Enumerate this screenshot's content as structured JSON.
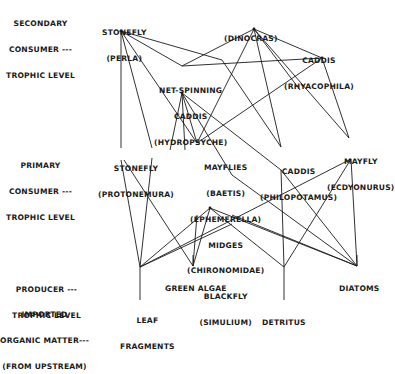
{
  "levels": [
    {
      "id": "secondary",
      "lines": [
        "SECONDARY",
        "CONSUMER ---",
        "TROPHIC LEVEL"
      ]
    },
    {
      "id": "primary",
      "lines": [
        "PRIMARY",
        "CONSUMER ---",
        "TROPHIC LEVEL"
      ]
    },
    {
      "id": "producer",
      "lines": [
        "PRODUCER ---",
        "TROPHIC LEVEL"
      ]
    },
    {
      "id": "imported",
      "lines": [
        "IMPORTED",
        "ORGANIC MATTER---",
        "(FROM UPSTREAM)"
      ]
    }
  ],
  "nodes": {
    "perla": {
      "lines": [
        "STONEFLY",
        "(PERLA)"
      ]
    },
    "dinocras": {
      "lines": [
        "(DINOCRAS)"
      ]
    },
    "rhyacophila": {
      "lines": [
        "CADDIS",
        "(RHYACOPHILA)"
      ]
    },
    "hydropsyche": {
      "lines": [
        "NET-SPINNING",
        "CADDIS",
        "(HYDROPSYCHE)"
      ]
    },
    "protonemura": {
      "lines": [
        "STONEFLY",
        "(PROTONEMURA)"
      ]
    },
    "baetis_group": {
      "lines": [
        "MAYFLIES",
        "(BAETIS)",
        "(EPHEMERELLA)",
        "MIDGES",
        "(CHIRONOMIDAE)",
        "BLACKFLY",
        "(SIMULIUM)"
      ]
    },
    "philopotamus": {
      "lines": [
        "CADDIS",
        "(PHILOPOTAMUS)"
      ]
    },
    "ecdyonurus": {
      "lines": [
        "MAYFLY",
        "(ECDYONURUS)"
      ]
    },
    "leaf": {
      "lines": [
        "LEAF",
        "FRAGMENTS"
      ]
    },
    "algae": {
      "lines": [
        "GREEN ALGAE"
      ]
    },
    "detritus": {
      "lines": [
        "DETRITUS"
      ]
    },
    "diatoms": {
      "lines": [
        "DIATOMS"
      ]
    }
  },
  "edges": [
    [
      121,
      31,
      121,
      148
    ],
    [
      121,
      31,
      152,
      148
    ],
    [
      121,
      31,
      182,
      66
    ],
    [
      121,
      31,
      197,
      143
    ],
    [
      121,
      31,
      222,
      60
    ],
    [
      222,
      60,
      281,
      147
    ],
    [
      254,
      29,
      182,
      66
    ],
    [
      254,
      29,
      322,
      58
    ],
    [
      254,
      29,
      197,
      143
    ],
    [
      254,
      29,
      281,
      147
    ],
    [
      254,
      29,
      349,
      138
    ],
    [
      254,
      29,
      300,
      90
    ],
    [
      322,
      58,
      182,
      66
    ],
    [
      322,
      58,
      197,
      143
    ],
    [
      322,
      58,
      349,
      138
    ],
    [
      182,
      93,
      197,
      143
    ],
    [
      182,
      93,
      170,
      150
    ],
    [
      182,
      93,
      185,
      150
    ],
    [
      182,
      93,
      281,
      170
    ],
    [
      182,
      93,
      232,
      175
    ],
    [
      121,
      160,
      140,
      267
    ],
    [
      152,
      158,
      140,
      267
    ],
    [
      124,
      160,
      193,
      266
    ],
    [
      140,
      267,
      351,
      159
    ],
    [
      140,
      267,
      210,
      208
    ],
    [
      140,
      267,
      232,
      224
    ],
    [
      197,
      215,
      193,
      266
    ],
    [
      210,
      208,
      193,
      266
    ],
    [
      210,
      208,
      284,
      267
    ],
    [
      210,
      208,
      357,
      266
    ],
    [
      232,
      215,
      357,
      266
    ],
    [
      281,
      170,
      284,
      267
    ],
    [
      281,
      170,
      357,
      266
    ],
    [
      351,
      159,
      284,
      267
    ],
    [
      351,
      159,
      357,
      266
    ],
    [
      232,
      175,
      357,
      266
    ],
    [
      140,
      267,
      140,
      300
    ],
    [
      284,
      267,
      284,
      300
    ],
    [
      193,
      255,
      193,
      266
    ],
    [
      357,
      255,
      357,
      266
    ]
  ],
  "ink_color": "#1a1a1a"
}
